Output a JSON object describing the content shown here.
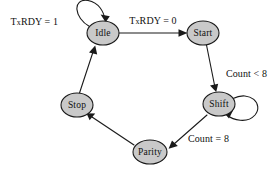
{
  "diagram": {
    "type": "finite-state-machine",
    "background_color": "#ffffff",
    "node_fill_color": "#c9c9c9",
    "node_stroke_color": "#1a1a1a",
    "text_color": "#101010",
    "nodes": [
      {
        "id": "idle",
        "label": "Idle",
        "cx": 103,
        "cy": 33,
        "rx": 16,
        "ry": 12
      },
      {
        "id": "start",
        "label": "Start",
        "cx": 203,
        "cy": 33,
        "rx": 16,
        "ry": 12
      },
      {
        "id": "shift",
        "label": "Shift",
        "cx": 219,
        "cy": 104,
        "rx": 16,
        "ry": 12
      },
      {
        "id": "parity",
        "label": "Parity",
        "cx": 150,
        "cy": 152,
        "rx": 17,
        "ry": 12
      },
      {
        "id": "stop",
        "label": "Stop",
        "cx": 77,
        "cy": 105,
        "rx": 16,
        "ry": 12
      }
    ],
    "transitions": [
      {
        "id": "idle-self",
        "from": "idle",
        "to": "idle",
        "label_prefix": "T",
        "label_small": "x",
        "label_rest": "RDY = 1",
        "label_text": "TxRDY = 1",
        "label_x": 58,
        "label_y": 23,
        "label_anchor": "end"
      },
      {
        "id": "idle-to-start",
        "from": "idle",
        "to": "start",
        "label_prefix": "T",
        "label_small": "x",
        "label_rest": "RDY = 0",
        "label_text": "TxRDY = 0",
        "label_x": 153,
        "label_y": 22,
        "label_anchor": "middle"
      },
      {
        "id": "start-to-shift",
        "from": "start",
        "to": "shift",
        "label_prefix": "",
        "label_small": "",
        "label_rest": "Count < 8",
        "label_text": "Count < 8",
        "label_x": 228,
        "label_y": 75,
        "label_anchor": "start"
      },
      {
        "id": "shift-self",
        "from": "shift",
        "to": "shift",
        "label_prefix": "",
        "label_small": "",
        "label_rest": "",
        "label_text": "",
        "label_x": 0,
        "label_y": 0,
        "label_anchor": "start"
      },
      {
        "id": "shift-to-parity",
        "from": "shift",
        "to": "parity",
        "label_prefix": "",
        "label_small": "",
        "label_rest": "Count = 8",
        "label_text": "Count = 8",
        "label_x": 188,
        "label_y": 140,
        "label_anchor": "start"
      },
      {
        "id": "parity-to-stop",
        "from": "parity",
        "to": "stop",
        "label_prefix": "",
        "label_small": "",
        "label_rest": "",
        "label_text": "",
        "label_x": 0,
        "label_y": 0,
        "label_anchor": "start"
      },
      {
        "id": "stop-to-idle",
        "from": "stop",
        "to": "idle",
        "label_prefix": "",
        "label_small": "",
        "label_rest": "",
        "label_text": "",
        "label_x": 0,
        "label_y": 0,
        "label_anchor": "start"
      }
    ]
  }
}
